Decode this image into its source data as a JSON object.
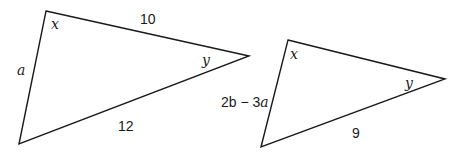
{
  "diagram": {
    "type": "similar-triangles",
    "line_color": "#1a1a1a",
    "background": "#ffffff",
    "triangles": [
      {
        "id": "left",
        "vertices": [
          [
            46,
            11
          ],
          [
            249,
            56
          ],
          [
            19,
            144
          ]
        ],
        "angle_labels": {
          "top": "x",
          "right": "y"
        },
        "side_labels": {
          "top": "10",
          "left": "a",
          "bottom": "12"
        }
      },
      {
        "id": "right",
        "vertices": [
          [
            288,
            40
          ],
          [
            445,
            79
          ],
          [
            261,
            147
          ]
        ],
        "angle_labels": {
          "top": "x",
          "right": "y"
        },
        "side_labels": {
          "left": "2b − 3a",
          "bottom": "9"
        }
      }
    ]
  },
  "labels": {
    "t1_angle_x": "x",
    "t1_angle_y": "y",
    "t1_side_top": "10",
    "t1_side_left": "a",
    "t1_side_bottom": "12",
    "t2_angle_x": "x",
    "t2_angle_y": "y",
    "t2_side_left_2b": "2b",
    "t2_side_left_minus": " − 3",
    "t2_side_left_a": "a",
    "t2_side_bottom": "9"
  }
}
